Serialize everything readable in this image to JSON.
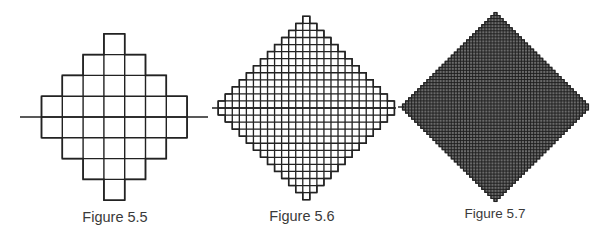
{
  "figures": [
    {
      "id": "fig-5-5",
      "caption": "Figure 5.5",
      "caption_x": 115,
      "caption_y": 210,
      "caption_size": 14.5,
      "center_x": 114.3,
      "axis_y": 117,
      "cell": 20.8,
      "half_rows": 4,
      "stroke_width": 1.4,
      "axis_line": [
        20,
        208
      ],
      "dense": false
    },
    {
      "id": "fig-5-6",
      "caption": "Figure 5.6",
      "caption_x": 302,
      "caption_y": 209,
      "caption_size": 14.5,
      "center_x": 306.3,
      "axis_y": 108,
      "cell": 7.05,
      "half_rows": 13,
      "stroke_width": 1.3,
      "axis_line": [
        212,
        396
      ],
      "dense": false
    },
    {
      "id": "fig-5-7",
      "caption": "Figure 5.7",
      "caption_x": 495,
      "caption_y": 207,
      "caption_size": 13.5,
      "center_x": 495.5,
      "axis_y": 107,
      "cell": 3.05,
      "half_rows": 31,
      "stroke_width": 0.9,
      "axis_line": [
        398,
        404
      ],
      "dense": true
    }
  ],
  "colors": {
    "line": "#222222",
    "dense_fill": "#6a6a6a",
    "caption": "#3a3a3a",
    "background": "#ffffff"
  }
}
